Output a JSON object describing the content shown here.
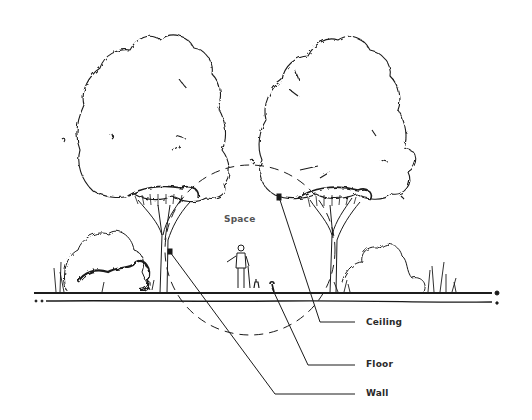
{
  "diagram": {
    "type": "landscape-section-sketch",
    "labels": {
      "space": "Space",
      "ceiling": "Ceiling",
      "floor": "Floor",
      "wall": "Wall"
    },
    "elements": [
      {
        "name": "left-tree",
        "kind": "deciduous tree"
      },
      {
        "name": "right-tree",
        "kind": "deciduous tree"
      },
      {
        "name": "space-circle",
        "kind": "dashed circle"
      },
      {
        "name": "human-figure",
        "kind": "person with dog"
      },
      {
        "name": "ground-line",
        "kind": "ground plane"
      },
      {
        "name": "left-shrubs",
        "kind": "shrubs"
      },
      {
        "name": "right-shrubs",
        "kind": "shrubs and grasses"
      }
    ],
    "colors": {
      "ink": "#1a1a1a",
      "background": "#ffffff"
    }
  }
}
